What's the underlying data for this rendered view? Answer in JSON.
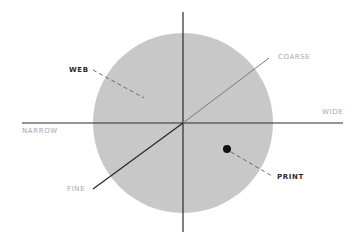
{
  "diagram": {
    "type": "quadrant-axes",
    "colors": {
      "circle_fill": "#c8c8c8",
      "axis_line": "#2a2a2a",
      "axis_label": "#a8a8a8",
      "point_label": "#2a2a2a",
      "point": "#111111",
      "leader": "#6a6a6a"
    },
    "axes": {
      "horizontal": {
        "left_label": "NARROW",
        "right_label": "WIDE"
      },
      "diagonal": {
        "low_label": "FINE",
        "high_label": "COARSE"
      }
    },
    "points": [
      {
        "label": "WEB",
        "marker": false
      },
      {
        "label": "PRINT",
        "marker": true
      }
    ]
  }
}
